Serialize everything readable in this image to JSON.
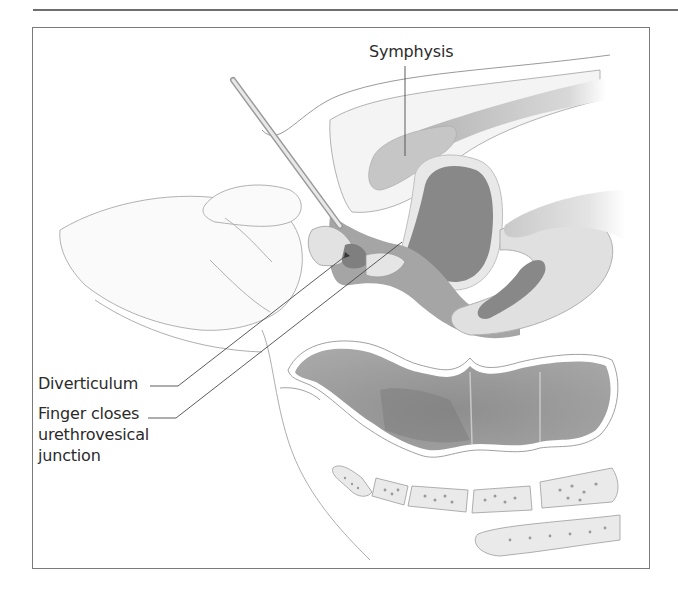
{
  "figure": {
    "labels": {
      "symphysis": "Symphysis",
      "diverticulum": "Diverticulum",
      "finger_closes": [
        "Finger closes",
        "urethrovesical",
        "junction"
      ]
    },
    "colors": {
      "frame": "#7a7a7a",
      "outline": "#8a8a8a",
      "light_tissue": "#e6e6e6",
      "mid_tissue": "#b4b4b4",
      "dark_tissue": "#8c8c8c",
      "label_text": "#2b2b2b"
    }
  }
}
